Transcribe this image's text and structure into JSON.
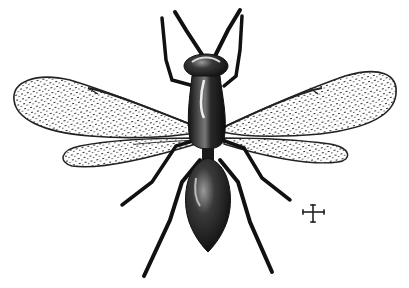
{
  "figure": {
    "style": "engraving",
    "background": "#ffffff",
    "ink": "#1a1a1a",
    "scale_mark": "cross-icon"
  }
}
